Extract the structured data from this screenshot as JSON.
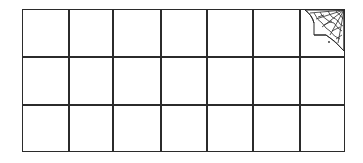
{
  "grid": {
    "rows": 3,
    "columns": 7,
    "column_edges_px": [
      0,
      47,
      91,
      139,
      185,
      231,
      278,
      323
    ],
    "row_edges_px": [
      0,
      48,
      96,
      143
    ],
    "line_color": "#2b2b2b",
    "background": "#ffffff"
  },
  "corner_decoration": {
    "position": "top-right cell",
    "icon": "cobweb-icon",
    "color": "#2b2b2b"
  }
}
